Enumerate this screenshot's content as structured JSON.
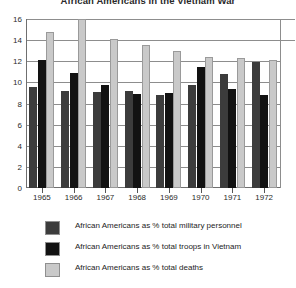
{
  "title": "African Americans in the Vietnam War",
  "chart_data": {
    "type": "bar",
    "title": "African Americans in the Vietnam War",
    "xlabel": "",
    "ylabel": "",
    "ylim": [
      0,
      16
    ],
    "yticks": [
      0,
      2,
      4,
      6,
      8,
      10,
      12,
      14,
      16
    ],
    "grid": true,
    "legend_position": "bottom",
    "categories": [
      "1965",
      "1966",
      "1967",
      "1968",
      "1969",
      "1970",
      "1971",
      "1972"
    ],
    "series": [
      {
        "name": "African Americans as % total military personnel",
        "color": "#3c3c3c",
        "values": [
          9.6,
          9.2,
          9.1,
          9.2,
          8.8,
          9.8,
          10.8,
          11.9
        ]
      },
      {
        "name": "African Americans as % total troops in Vietnam",
        "color": "#121212",
        "values": [
          12.1,
          10.9,
          9.8,
          8.9,
          9.0,
          11.5,
          9.4,
          8.8
        ]
      },
      {
        "name": "African Americans as % total deaths",
        "color": "#c9c9c9",
        "values": [
          14.8,
          16.3,
          14.1,
          13.5,
          13.0,
          12.4,
          12.3,
          12.1
        ]
      }
    ]
  },
  "legend": {
    "items": [
      {
        "label": "African Americans as % total military personnel",
        "swatch": "#3c3c3c"
      },
      {
        "label": "African Americans as % total troops in Vietnam",
        "swatch": "#121212"
      },
      {
        "label": "African Americans as % total deaths",
        "swatch": "#c9c9c9"
      }
    ]
  }
}
